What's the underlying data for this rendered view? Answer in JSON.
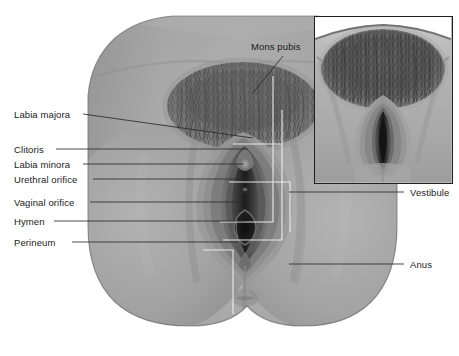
{
  "figure": {
    "background_color": "#ffffff",
    "text_color": "#1a1a1a",
    "skin_tone": "#a9a9a9",
    "hair_tone": "#6a6a6a",
    "inset_border_color": "#1f1f1f",
    "leader_line_color": "#2b2b2b",
    "callout_outline_color": "#f2f2f2"
  },
  "labels": {
    "left": [
      {
        "text": "Labia majora",
        "x": 14,
        "y": 110
      },
      {
        "text": "Clitoris",
        "x": 14,
        "y": 145
      },
      {
        "text": "Labia minora",
        "x": 14,
        "y": 160
      },
      {
        "text": "Urethral orifice",
        "x": 14,
        "y": 175
      },
      {
        "text": "Vaginal orifice",
        "x": 14,
        "y": 198
      },
      {
        "text": "Hymen",
        "x": 14,
        "y": 217
      },
      {
        "text": "Perineum",
        "x": 14,
        "y": 238
      }
    ],
    "right": [
      {
        "text": "Vestibule",
        "x": 408,
        "y": 188
      },
      {
        "text": "Anus",
        "x": 408,
        "y": 260
      }
    ],
    "top": [
      {
        "text": "Mons pubis",
        "x": 251,
        "y": 47
      }
    ]
  },
  "inset": {
    "caption": "",
    "description": "close-up view of vulva"
  },
  "regions": {
    "mons_pubis": "pubic hair triangle",
    "labia_majora": "outer folds",
    "labia_minora": "inner folds",
    "clitoris": "clitoral glans",
    "urethral_orifice": "urethral opening",
    "vaginal_orifice": "vaginal opening",
    "hymen": "hymenal ring",
    "perineum": "perineal body",
    "vestibule": "vestibular area",
    "anus": "anal opening"
  }
}
